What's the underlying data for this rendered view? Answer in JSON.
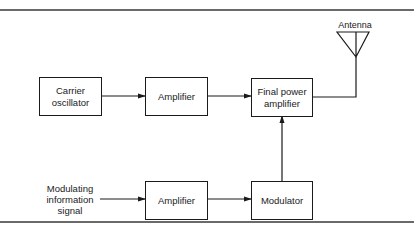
{
  "diagram": {
    "type": "block-diagram",
    "title": "",
    "blocks": {
      "carrier_oscillator": "Carrier\noscillator",
      "amplifier_top": "Amplifier",
      "final_power_amplifier": "Final power\namplifier",
      "amplifier_bottom": "Amplifier",
      "modulator": "Modulator"
    },
    "labels": {
      "antenna": "Antenna",
      "input_signal": "Modulating\ninformation\nsignal"
    },
    "connections": [
      {
        "from": "carrier_oscillator",
        "to": "amplifier_top"
      },
      {
        "from": "amplifier_top",
        "to": "final_power_amplifier"
      },
      {
        "from": "input_signal",
        "to": "amplifier_bottom"
      },
      {
        "from": "amplifier_bottom",
        "to": "modulator"
      },
      {
        "from": "modulator",
        "to": "final_power_amplifier"
      },
      {
        "from": "final_power_amplifier",
        "to": "antenna"
      }
    ]
  },
  "colors": {
    "line": "#1a1a1a",
    "rule": "#6a6a6a"
  }
}
